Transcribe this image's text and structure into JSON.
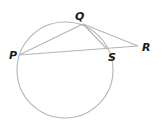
{
  "diagram": {
    "type": "circle-secant-tangent",
    "stroke_color": "#b5b5b5",
    "label_color": "#1a1a1a",
    "circle": {
      "cx": 65,
      "cy": 70,
      "r": 48
    },
    "points": {
      "P": {
        "label": "P",
        "x": 19,
        "y": 55
      },
      "Q": {
        "label": "Q",
        "x": 83,
        "y": 24
      },
      "S": {
        "label": "S",
        "x": 107,
        "y": 49
      },
      "R": {
        "label": "R",
        "x": 138,
        "y": 46
      }
    },
    "segments": [
      {
        "from": "P",
        "to": "Q"
      },
      {
        "from": "Q",
        "to": "S"
      },
      {
        "from": "Q",
        "to": "R"
      },
      {
        "from": "P",
        "to": "R"
      }
    ]
  }
}
